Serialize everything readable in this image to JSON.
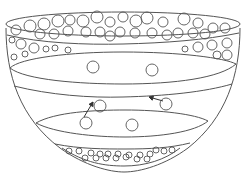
{
  "diagram": {
    "title": "",
    "stroke_color": "#555555",
    "background": "#ffffff",
    "regions": [
      {
        "id": "top-particle-layer",
        "label": "",
        "particle_density": "dense"
      },
      {
        "id": "upper-clear-layer",
        "label": "",
        "particle_count": 2
      },
      {
        "id": "middle-layer",
        "label": "",
        "particle_count": 1
      },
      {
        "id": "lower-layer",
        "label": "",
        "particle_count": 2
      },
      {
        "id": "bottom-sediment-layer",
        "label": "",
        "particle_density": "dense"
      }
    ],
    "arrows": [
      {
        "id": "arrow-left",
        "direction": "up-right",
        "from": [
          84,
          117
        ],
        "to": [
          93,
          102
        ]
      },
      {
        "id": "arrow-right",
        "direction": "up-left",
        "from": [
          163,
          101
        ],
        "to": [
          149,
          97
        ]
      }
    ],
    "top_particles": [
      [
        16,
        30,
        5
      ],
      [
        30,
        26,
        6
      ],
      [
        44,
        24,
        6
      ],
      [
        58,
        21,
        6
      ],
      [
        70,
        20,
        5
      ],
      [
        83,
        21,
        6
      ],
      [
        97,
        17,
        6
      ],
      [
        110,
        22,
        5
      ],
      [
        123,
        17,
        5
      ],
      [
        136,
        21,
        6
      ],
      [
        147,
        18,
        6
      ],
      [
        163,
        22,
        5
      ],
      [
        184,
        19,
        6
      ],
      [
        198,
        23,
        5
      ],
      [
        213,
        28,
        5
      ],
      [
        225,
        28,
        5
      ],
      [
        40,
        34,
        5
      ],
      [
        54,
        34,
        5
      ],
      [
        68,
        31,
        5
      ],
      [
        86,
        32,
        5
      ],
      [
        100,
        32,
        5
      ],
      [
        110,
        36,
        5
      ],
      [
        120,
        32,
        5
      ],
      [
        135,
        33,
        5
      ],
      [
        152,
        33,
        5
      ],
      [
        167,
        35,
        5
      ],
      [
        178,
        33,
        5
      ],
      [
        193,
        33,
        5
      ],
      [
        205,
        34,
        5
      ],
      [
        12,
        40,
        3
      ],
      [
        21,
        44,
        5
      ],
      [
        34,
        48,
        5
      ],
      [
        46,
        49,
        3
      ],
      [
        55,
        48,
        3
      ],
      [
        68,
        50,
        3
      ],
      [
        185,
        49,
        3
      ],
      [
        198,
        47,
        5
      ],
      [
        212,
        45,
        5
      ],
      [
        227,
        43,
        5
      ],
      [
        217,
        55,
        4
      ],
      [
        227,
        55,
        5
      ],
      [
        14,
        57,
        3
      ],
      [
        25,
        54,
        3
      ]
    ],
    "mid_particles": [
      [
        93,
        67,
        6
      ],
      [
        152,
        70,
        6
      ],
      [
        100,
        106,
        6
      ],
      [
        166,
        104,
        6
      ],
      [
        86,
        123,
        6
      ],
      [
        132,
        125,
        6
      ]
    ],
    "bottom_particles": [
      [
        69,
        151,
        3
      ],
      [
        79,
        151,
        3
      ],
      [
        91,
        153,
        3
      ],
      [
        100,
        154,
        3
      ],
      [
        108,
        154,
        3
      ],
      [
        118,
        154,
        3
      ],
      [
        129,
        155,
        3
      ],
      [
        140,
        155,
        3
      ],
      [
        150,
        154,
        3
      ],
      [
        156,
        150,
        3
      ],
      [
        164,
        151,
        3
      ],
      [
        172,
        150,
        3
      ],
      [
        85,
        158,
        3
      ],
      [
        96,
        158,
        3
      ],
      [
        106,
        158,
        3
      ],
      [
        116,
        158,
        3
      ],
      [
        126,
        157,
        3
      ],
      [
        137,
        159,
        3
      ],
      [
        147,
        159,
        3
      ]
    ]
  }
}
